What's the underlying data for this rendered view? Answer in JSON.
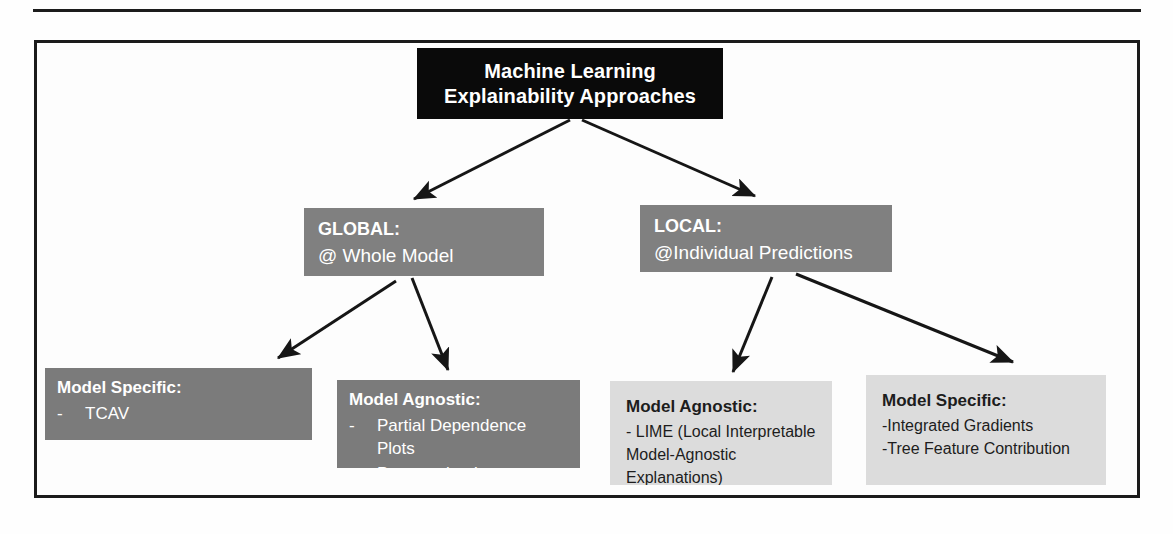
{
  "figure": {
    "root": {
      "line1": "Machine Learning",
      "line2": "Explainability Approaches"
    },
    "branches": [
      {
        "id": "global",
        "title": "GLOBAL:",
        "subtitle": "@ Whole Model"
      },
      {
        "id": "local",
        "title": "LOCAL:",
        "subtitle": "@Individual Predictions"
      }
    ],
    "leaves": [
      {
        "id": "tcav",
        "title": "Model Specific:",
        "dash": "-",
        "items": [
          "TCAV"
        ]
      },
      {
        "id": "pdp",
        "title": "Model Agnostic:",
        "dash": "-",
        "items": [
          "Partial Dependence Plots",
          "Permutation Importance"
        ]
      },
      {
        "id": "lime",
        "title": "Model Agnostic:",
        "lines": [
          "- LIME (Local Interpretable",
          "Model-Agnostic Explanations)"
        ]
      },
      {
        "id": "model-specific-local",
        "title": "Model Specific:",
        "lines": [
          "-Integrated Gradients",
          "-Tree Feature Contribution"
        ]
      }
    ],
    "colors": {
      "root_bg": "#0a0a0a",
      "root_text": "#ffffff",
      "branch_bg": "#808080",
      "branch_text": "#ffffff",
      "leaf_dark_bg": "#7b7b7b",
      "leaf_dark_text": "#ffffff",
      "leaf_light_bg": "#dcdcdc",
      "leaf_light_text": "#1d1d1d",
      "frame_border": "#1b1b1b",
      "arrow": "#161616",
      "page_bg": "#ffffff"
    }
  }
}
